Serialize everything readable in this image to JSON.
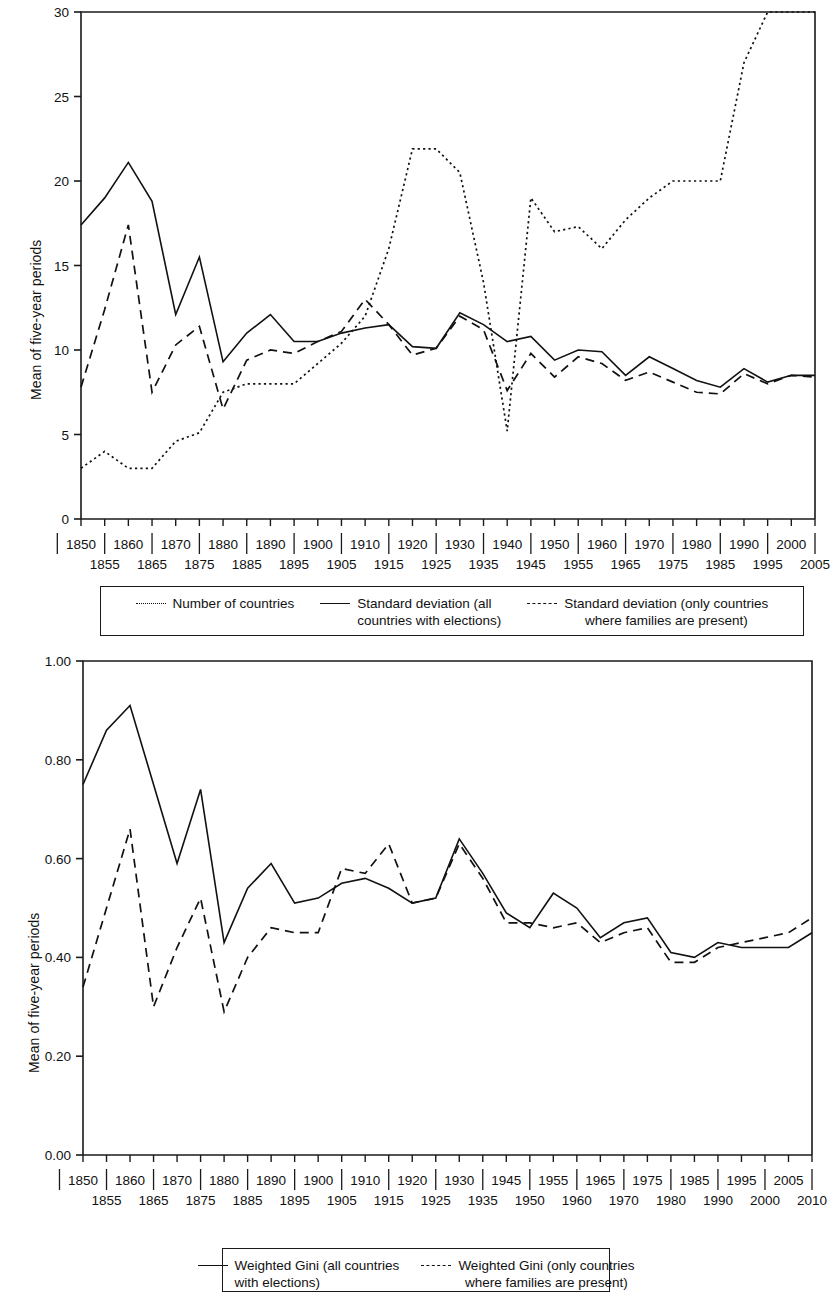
{
  "figure": {
    "panels": [
      {
        "id": "top",
        "ylabel": "Mean of five-year periods",
        "legend": [
          {
            "style": "dotted",
            "line1": "Number of countries",
            "line2": ""
          },
          {
            "style": "solid",
            "line1": "Standard deviation (all",
            "line2": "countries with elections)"
          },
          {
            "style": "dashed",
            "line1": "Standard deviation (only countries",
            "line2": "where families are present)"
          }
        ]
      },
      {
        "id": "bottom",
        "ylabel": "Mean of five-year periods",
        "legend": [
          {
            "style": "solid",
            "line1": "Weighted Gini (all countries",
            "line2": "with elections)"
          },
          {
            "style": "dashed",
            "line1": "Weighted Gini (only countries",
            "line2": "where families are present)"
          }
        ]
      }
    ]
  },
  "chart_data": [
    {
      "type": "line",
      "title": "",
      "xlabel": "",
      "ylabel": "Mean of five-year periods",
      "ylim": [
        0,
        30
      ],
      "yticks": [
        0,
        5,
        10,
        15,
        20,
        25,
        30
      ],
      "ytick_labels": [
        "0",
        "5",
        "10",
        "15",
        "20",
        "25",
        "30"
      ],
      "grid": false,
      "legend_position": "below",
      "xtick_labels_row1": [
        "1850",
        "1860",
        "1870",
        "1880",
        "1890",
        "1900",
        "1910",
        "1920",
        "1930",
        "1940",
        "1950",
        "1960",
        "1970",
        "1980",
        "1990",
        "2000"
      ],
      "xtick_labels_row2": [
        "1855",
        "1865",
        "1875",
        "1885",
        "1895",
        "1905",
        "1915",
        "1925",
        "1935",
        "1945",
        "1955",
        "1965",
        "1975",
        "1985",
        "1995",
        "2005"
      ],
      "x": [
        1850,
        1855,
        1860,
        1865,
        1870,
        1875,
        1880,
        1885,
        1890,
        1895,
        1900,
        1905,
        1910,
        1915,
        1920,
        1925,
        1930,
        1935,
        1940,
        1945,
        1950,
        1955,
        1960,
        1965,
        1970,
        1975,
        1980,
        1985,
        1990,
        1995,
        2000,
        2005
      ],
      "series": [
        {
          "name": "Number of countries",
          "style": "dotted",
          "values": [
            3.0,
            4.0,
            3.0,
            3.0,
            4.6,
            5.1,
            7.5,
            8.0,
            8.0,
            8.0,
            9.2,
            10.4,
            12.0,
            16.0,
            21.9,
            21.9,
            20.5,
            14.0,
            5.2,
            19.0,
            17.0,
            17.3,
            16.0,
            17.7,
            19.0,
            20.0,
            20.0,
            20.0,
            27.0,
            30.0,
            30.0,
            30.0
          ]
        },
        {
          "name": "Standard deviation (all countries with elections)",
          "style": "solid",
          "values": [
            17.4,
            19.0,
            21.1,
            18.8,
            12.1,
            15.5,
            9.3,
            11.0,
            12.1,
            10.5,
            10.5,
            11.0,
            11.3,
            11.5,
            10.2,
            10.1,
            12.2,
            11.5,
            10.5,
            10.8,
            9.4,
            10.0,
            9.9,
            8.5,
            9.6,
            8.9,
            8.2,
            7.8,
            8.9,
            8.1,
            8.5,
            8.5
          ]
        },
        {
          "name": "Standard deviation (only countries where families are present)",
          "style": "dashed",
          "values": [
            7.8,
            12.4,
            17.4,
            7.5,
            10.3,
            11.4,
            6.5,
            9.4,
            10.0,
            9.8,
            10.5,
            11.1,
            13.0,
            11.5,
            9.7,
            10.1,
            12.0,
            11.2,
            7.6,
            9.8,
            8.4,
            9.6,
            9.2,
            8.2,
            8.7,
            8.1,
            7.5,
            7.4,
            8.6,
            8.0,
            8.5,
            8.4
          ]
        }
      ]
    },
    {
      "type": "line",
      "title": "",
      "xlabel": "",
      "ylabel": "Mean of five-year periods",
      "ylim": [
        0.0,
        1.0
      ],
      "yticks": [
        0.0,
        0.2,
        0.4,
        0.6,
        0.8,
        1.0
      ],
      "ytick_labels": [
        "0.00",
        "0.20",
        "0.40",
        "0.60",
        "0.80",
        "1.00"
      ],
      "grid": false,
      "legend_position": "below",
      "xtick_labels_row1": [
        "1850",
        "1860",
        "1870",
        "1880",
        "1890",
        "1900",
        "1910",
        "1920",
        "1930",
        "1945",
        "1955",
        "1965",
        "1975",
        "1985",
        "1995",
        "2005"
      ],
      "xtick_labels_row2": [
        "1855",
        "1865",
        "1875",
        "1885",
        "1895",
        "1905",
        "1915",
        "1925",
        "1935",
        "1950",
        "1960",
        "1970",
        "1980",
        "1990",
        "2000",
        "2010"
      ],
      "x": [
        1850,
        1855,
        1860,
        1865,
        1870,
        1875,
        1880,
        1885,
        1890,
        1895,
        1900,
        1905,
        1910,
        1915,
        1920,
        1925,
        1930,
        1935,
        1945,
        1950,
        1955,
        1960,
        1965,
        1970,
        1975,
        1980,
        1985,
        1990,
        1995,
        2000,
        2005,
        2010
      ],
      "series": [
        {
          "name": "Weighted Gini (all countries with elections)",
          "style": "solid",
          "values": [
            0.75,
            0.86,
            0.91,
            0.75,
            0.59,
            0.74,
            0.43,
            0.54,
            0.59,
            0.51,
            0.52,
            0.55,
            0.56,
            0.54,
            0.51,
            0.52,
            0.64,
            0.57,
            0.49,
            0.46,
            0.53,
            0.5,
            0.44,
            0.47,
            0.48,
            0.41,
            0.4,
            0.43,
            0.42,
            0.42,
            0.42,
            0.45
          ]
        },
        {
          "name": "Weighted Gini (only countries where families are present)",
          "style": "dashed",
          "values": [
            0.34,
            0.5,
            0.66,
            0.3,
            0.42,
            0.52,
            0.29,
            0.4,
            0.46,
            0.45,
            0.45,
            0.58,
            0.57,
            0.63,
            0.51,
            0.52,
            0.63,
            0.56,
            0.47,
            0.47,
            0.46,
            0.47,
            0.43,
            0.45,
            0.46,
            0.39,
            0.39,
            0.42,
            0.43,
            0.44,
            0.45,
            0.48
          ]
        }
      ]
    }
  ]
}
